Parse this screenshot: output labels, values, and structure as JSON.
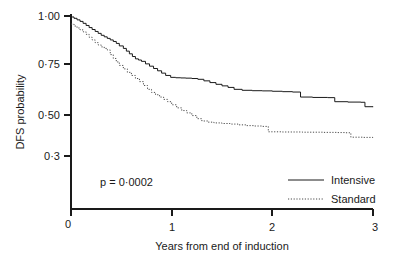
{
  "chart_data": {
    "type": "line",
    "title": "",
    "subtitle": "",
    "xlabel": "Years from end of induction",
    "ylabel": "DFS probability",
    "xlim": [
      0,
      3
    ],
    "ylim": [
      0,
      1
    ],
    "grid": false,
    "x_ticks": [
      "0",
      "1",
      "2",
      "3"
    ],
    "x_tick_values": [
      0,
      1,
      2,
      3
    ],
    "y_ticks": [
      "1·00",
      "0·75",
      "0·50",
      "0·3"
    ],
    "y_tick_values": [
      1.0,
      0.75,
      0.5,
      0.3
    ],
    "legend_position": "bottom-right",
    "annotations": [
      {
        "name": "p-value",
        "text": "p = 0·0002",
        "x": 0.42,
        "y": 0.245
      }
    ],
    "series": [
      {
        "name": "Intensive",
        "style": "solid",
        "color": "#1a1a1a",
        "step": "post",
        "x": [
          0.0,
          0.03,
          0.06,
          0.09,
          0.12,
          0.15,
          0.18,
          0.21,
          0.24,
          0.27,
          0.3,
          0.33,
          0.36,
          0.39,
          0.42,
          0.45,
          0.48,
          0.52,
          0.55,
          0.58,
          0.61,
          0.64,
          0.67,
          0.7,
          0.74,
          0.78,
          0.82,
          0.86,
          0.9,
          0.94,
          0.99,
          1.04,
          1.09,
          1.14,
          1.2,
          1.26,
          1.32,
          1.38,
          1.44,
          1.5,
          1.56,
          1.62,
          1.7,
          1.8,
          1.9,
          2.0,
          2.1,
          2.2,
          2.28,
          2.4,
          2.55,
          2.62,
          2.75,
          2.88,
          2.92,
          3.0
        ],
        "y": [
          0.995,
          0.988,
          0.98,
          0.972,
          0.962,
          0.951,
          0.94,
          0.93,
          0.92,
          0.91,
          0.9,
          0.892,
          0.884,
          0.876,
          0.868,
          0.858,
          0.845,
          0.832,
          0.818,
          0.804,
          0.79,
          0.778,
          0.772,
          0.765,
          0.752,
          0.74,
          0.728,
          0.716,
          0.704,
          0.692,
          0.682,
          0.68,
          0.679,
          0.678,
          0.676,
          0.672,
          0.664,
          0.655,
          0.646,
          0.638,
          0.63,
          0.62,
          0.615,
          0.613,
          0.612,
          0.61,
          0.608,
          0.606,
          0.58,
          0.578,
          0.577,
          0.556,
          0.554,
          0.553,
          0.53,
          0.528
        ]
      },
      {
        "name": "Standard",
        "style": "dotted",
        "color": "#4a4a4a",
        "step": "post",
        "x": [
          0.0,
          0.03,
          0.06,
          0.09,
          0.12,
          0.15,
          0.18,
          0.21,
          0.24,
          0.27,
          0.3,
          0.33,
          0.36,
          0.39,
          0.42,
          0.45,
          0.48,
          0.52,
          0.56,
          0.6,
          0.64,
          0.68,
          0.72,
          0.76,
          0.8,
          0.84,
          0.88,
          0.92,
          0.96,
          1.0,
          1.05,
          1.1,
          1.15,
          1.2,
          1.25,
          1.3,
          1.36,
          1.42,
          1.5,
          1.58,
          1.66,
          1.74,
          1.82,
          1.9,
          1.96,
          2.1,
          2.3,
          2.5,
          2.65,
          2.72,
          2.78,
          2.9,
          3.0
        ],
        "y": [
          0.958,
          0.948,
          0.938,
          0.928,
          0.918,
          0.905,
          0.89,
          0.876,
          0.862,
          0.85,
          0.84,
          0.832,
          0.824,
          0.8,
          0.78,
          0.762,
          0.744,
          0.726,
          0.708,
          0.692,
          0.676,
          0.66,
          0.64,
          0.62,
          0.604,
          0.592,
          0.58,
          0.568,
          0.556,
          0.54,
          0.524,
          0.51,
          0.498,
          0.484,
          0.468,
          0.456,
          0.45,
          0.446,
          0.443,
          0.44,
          0.436,
          0.432,
          0.43,
          0.428,
          0.4,
          0.399,
          0.398,
          0.397,
          0.396,
          0.395,
          0.372,
          0.371,
          0.37
        ]
      }
    ]
  },
  "legend": {
    "items": [
      {
        "label": "Intensive",
        "style": "solid"
      },
      {
        "label": "Standard",
        "style": "dotted"
      }
    ]
  }
}
